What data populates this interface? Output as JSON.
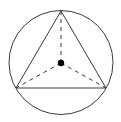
{
  "diagram": {
    "colors": {
      "stroke": "#3a3a3a",
      "background": "#ffffff",
      "center_dot": "#000000"
    },
    "circle": {
      "cx": 61,
      "cy": 62.5,
      "r": 52
    },
    "center": {
      "x": 61,
      "y": 63,
      "r": 3.2
    },
    "vertices": [
      {
        "name": "top",
        "x": 61,
        "y": 11
      },
      {
        "name": "bottom-left",
        "x": 16,
        "y": 88
      },
      {
        "name": "bottom-right",
        "x": 106,
        "y": 88
      }
    ]
  }
}
